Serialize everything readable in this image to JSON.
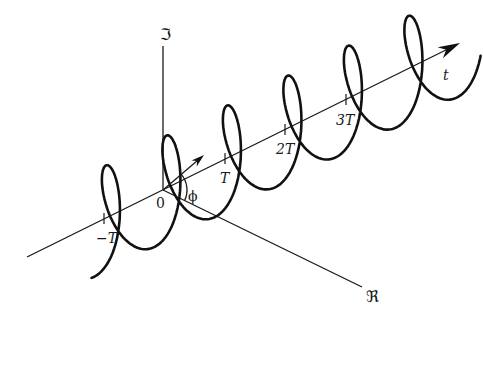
{
  "figure": {
    "origin": {
      "x": 163,
      "y": 190
    },
    "axes": {
      "imaginary": {
        "label": "ℑ",
        "end": {
          "x": 163,
          "y": 46
        },
        "label_pos": {
          "x": 160,
          "y": 40
        }
      },
      "real": {
        "label": "ℜ",
        "end": {
          "x": 362,
          "y": 287
        },
        "label_pos": {
          "x": 366,
          "y": 302
        }
      },
      "time": {
        "label": "t",
        "start": {
          "x": 27,
          "y": 257
        },
        "end": {
          "x": 460,
          "y": 43
        },
        "label_pos": {
          "x": 443,
          "y": 80
        }
      }
    },
    "ticks": [
      {
        "label": "−T",
        "x": 104,
        "y": 219,
        "label_x": 96,
        "label_y": 243
      },
      {
        "label": "T",
        "x": 225,
        "y": 159,
        "label_x": 220,
        "label_y": 183
      },
      {
        "label": "2T",
        "x": 285,
        "y": 130,
        "label_x": 276,
        "label_y": 154
      },
      {
        "label": "3T",
        "x": 346,
        "y": 100,
        "label_x": 336,
        "label_y": 125
      }
    ],
    "origin_label": "0",
    "phase_label": "ϕ",
    "phasor": {
      "from": {
        "x": 163,
        "y": 190
      },
      "to": {
        "x": 204,
        "y": 155
      }
    },
    "helix": {
      "period_dx": 60.5,
      "period_dy": -29.9,
      "amp_up": 48,
      "amp_real_dx": 22,
      "amp_real_dy": 11,
      "theta_start_deg": -470,
      "theta_end_deg": 1760,
      "phase_deg": 40
    }
  }
}
